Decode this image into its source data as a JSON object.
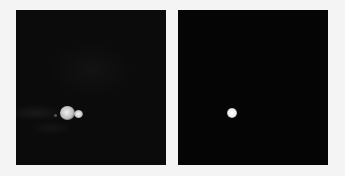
{
  "image": {
    "description": "Two side-by-side grayscale microscopy-style panels on light background",
    "background_color": "#f4f4f4",
    "panels": [
      {
        "id": "left",
        "label": "",
        "background_color": "#0b0b0b",
        "features": [
          {
            "type": "bright-blob",
            "cx": 51,
            "cy": 103,
            "r": 7,
            "color": "#d8d8d8"
          },
          {
            "type": "bright-blob",
            "cx": 62,
            "cy": 104,
            "r": 4,
            "color": "#e6e6e6"
          },
          {
            "type": "faint-streaks",
            "region": "left-middle"
          }
        ]
      },
      {
        "id": "right",
        "label": "",
        "background_color": "#050505",
        "features": [
          {
            "type": "bright-dot",
            "cx": 54,
            "cy": 103,
            "r": 5,
            "color": "#f2f2f2"
          }
        ]
      }
    ]
  }
}
